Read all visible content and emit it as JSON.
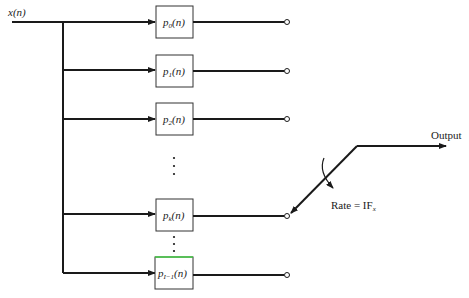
{
  "diagram": {
    "type": "polyphase-interpolator-commutator",
    "input_label": "x(n)",
    "output_label": "Output",
    "rate_label": "Rate = IF",
    "rate_subscript": "x",
    "branches": [
      {
        "name": "p",
        "sub": "0",
        "arg": "(n)",
        "y": 22
      },
      {
        "name": "p",
        "sub": "1",
        "arg": "(n)",
        "y": 71
      },
      {
        "name": "p",
        "sub": "2",
        "arg": "(n)",
        "y": 119
      },
      {
        "name": "p",
        "sub": "k",
        "arg": "(n)",
        "y": 215
      },
      {
        "name": "p",
        "sub": "I−1",
        "arg": "(n)",
        "y": 272
      }
    ],
    "ellipsis": "⋮",
    "colors": {
      "line": "#1a1a1a",
      "box_border": "#333333",
      "highlight": "#44cc44"
    }
  }
}
